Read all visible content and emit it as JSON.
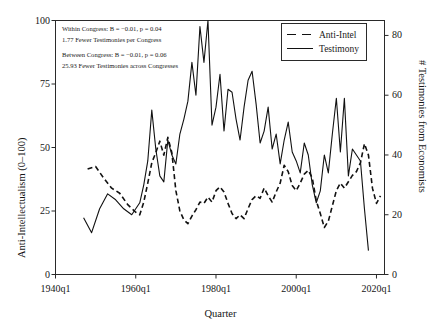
{
  "chart_data": {
    "type": "line",
    "title": "",
    "xlabel": "Quarter",
    "ylabel": "Anti-Intellectualism (0–100)",
    "y2label": "# Testimonies from Economists",
    "xlim": [
      1940,
      2022
    ],
    "ylim": [
      0,
      100
    ],
    "y2lim": [
      0,
      85
    ],
    "grid": false,
    "legend_position": "top-right",
    "xticks": [
      "1940q1",
      "1960q1",
      "1980q1",
      "2000q1",
      "2020q1"
    ],
    "xtickvals": [
      1940,
      1960,
      1980,
      2000,
      2020
    ],
    "yticks": [
      "0",
      "25",
      "50",
      "75",
      "100"
    ],
    "ytickvals": [
      0,
      25,
      50,
      75,
      100
    ],
    "y2ticks": [
      "0",
      "20",
      "40",
      "60",
      "80"
    ],
    "y2tickvals": [
      0,
      20,
      40,
      60,
      80
    ],
    "annotations": [
      "Within Congress: B = −0.01, p = 0.04",
      "1.77 Fewer Testimonies per Congress",
      "Between Congress: B = −0.01, p = 0.06",
      "25.93 Fewer Testimonies across Congresses"
    ],
    "series": [
      {
        "name": "Anti-Intel",
        "style": "dashed",
        "axis": "left",
        "color": "#111111",
        "x": [
          1948.0,
          1950.0,
          1952.0,
          1954.0,
          1956.0,
          1958.0,
          1960.0,
          1961.0,
          1962.0,
          1963.0,
          1964.0,
          1965.0,
          1966.0,
          1967.0,
          1968.0,
          1969.0,
          1970.0,
          1971.0,
          1972.0,
          1973.0,
          1974.0,
          1975.0,
          1976.0,
          1977.0,
          1978.0,
          1979.0,
          1980.0,
          1981.0,
          1982.0,
          1983.0,
          1984.0,
          1985.0,
          1986.0,
          1987.0,
          1988.0,
          1989.0,
          1990.0,
          1991.0,
          1992.0,
          1993.0,
          1994.0,
          1995.0,
          1996.0,
          1997.0,
          1998.0,
          1999.0,
          2000.0,
          2001.0,
          2002.0,
          2003.0,
          2004.0,
          2005.0,
          2006.0,
          2007.0,
          2008.0,
          2009.0,
          2010.0,
          2011.0,
          2012.0,
          2013.0,
          2014.0,
          2015.0,
          2016.0,
          2017.0,
          2018.0,
          2019.0,
          2020.0,
          2021.0
        ],
        "y": [
          41.5,
          42.5,
          38.0,
          34.0,
          32.0,
          27.5,
          24.5,
          23.5,
          28.5,
          36.0,
          44.0,
          48.0,
          52.5,
          47.0,
          54.0,
          48.0,
          33.0,
          25.0,
          21.5,
          20.0,
          23.0,
          25.5,
          28.5,
          28.0,
          30.5,
          28.5,
          33.0,
          34.5,
          32.5,
          28.0,
          24.0,
          22.0,
          23.5,
          22.0,
          26.0,
          29.5,
          31.0,
          30.0,
          34.0,
          31.0,
          28.5,
          32.5,
          36.0,
          43.0,
          40.5,
          35.0,
          33.0,
          36.0,
          39.5,
          41.0,
          38.0,
          29.0,
          24.0,
          18.5,
          21.0,
          27.0,
          33.0,
          36.0,
          34.0,
          36.5,
          39.0,
          40.5,
          44.0,
          51.5,
          47.0,
          34.0,
          28.0,
          31.0
        ]
      },
      {
        "name": "Testimony",
        "style": "solid",
        "axis": "right",
        "color": "#111111",
        "x": [
          1947.0,
          1949.0,
          1951.0,
          1953.0,
          1955.0,
          1957.0,
          1959.0,
          1961.0,
          1962.0,
          1963.0,
          1964.0,
          1965.0,
          1966.0,
          1967.0,
          1968.0,
          1969.0,
          1970.0,
          1971.0,
          1972.0,
          1973.0,
          1974.0,
          1975.0,
          1976.0,
          1977.0,
          1978.0,
          1979.0,
          1980.0,
          1981.0,
          1982.0,
          1983.0,
          1984.0,
          1985.0,
          1986.0,
          1987.0,
          1988.0,
          1989.0,
          1990.0,
          1991.0,
          1992.0,
          1993.0,
          1994.0,
          1995.0,
          1996.0,
          1997.0,
          1998.0,
          1999.0,
          2000.0,
          2001.0,
          2002.0,
          2003.0,
          2004.0,
          2005.0,
          2006.0,
          2007.0,
          2008.0,
          2009.0,
          2010.0,
          2011.0,
          2012.0,
          2013.0,
          2014.0,
          2015.0,
          2016.0,
          2017.0,
          2018.0
        ],
        "y": [
          19,
          14,
          22,
          27,
          25,
          22,
          20,
          24,
          30,
          38,
          55,
          42,
          33,
          31,
          45,
          40,
          37,
          47,
          52,
          58,
          71,
          60,
          83,
          71,
          85,
          50,
          56,
          67,
          48,
          62,
          61,
          52,
          45,
          56,
          65,
          68,
          57,
          44,
          48,
          56,
          42,
          47,
          37,
          45,
          51,
          41,
          38,
          34,
          44,
          40,
          30,
          24,
          28,
          40,
          34,
          47,
          59,
          41,
          59,
          33,
          42,
          40,
          38,
          22,
          8
        ]
      }
    ]
  },
  "legend": {
    "items": [
      {
        "label": "Anti-Intel",
        "style": "dashed"
      },
      {
        "label": "Testimony",
        "style": "solid"
      }
    ]
  }
}
